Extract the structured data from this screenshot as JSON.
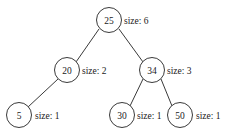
{
  "diagram": {
    "kind": "binary-search-tree-with-subtree-sizes",
    "size_label_prefix": "size:",
    "colors": {
      "background": "#ffffff",
      "stroke": "#3a3a3a",
      "text": "#1a1a1a"
    },
    "nodes": [
      {
        "id": "n25",
        "key": "25",
        "size_text": "size: 6",
        "size_value": 6,
        "cx": 109,
        "cy": 20,
        "r": 12.5,
        "label_x": 124,
        "label_y": 20
      },
      {
        "id": "n20",
        "key": "20",
        "size_text": "size: 2",
        "size_value": 2,
        "cx": 67,
        "cy": 70,
        "r": 12.5,
        "label_x": 82,
        "label_y": 70
      },
      {
        "id": "n34",
        "key": "34",
        "size_text": "size: 3",
        "size_value": 3,
        "cx": 152,
        "cy": 70,
        "r": 12.5,
        "label_x": 167,
        "label_y": 70
      },
      {
        "id": "n5",
        "key": "5",
        "size_text": "size: 1",
        "size_value": 1,
        "cx": 19,
        "cy": 115,
        "r": 12.5,
        "label_x": 35,
        "label_y": 115
      },
      {
        "id": "n30",
        "key": "30",
        "size_text": "size: 1",
        "size_value": 1,
        "cx": 122,
        "cy": 115,
        "r": 12.5,
        "label_x": 137,
        "label_y": 115
      },
      {
        "id": "n50",
        "key": "50",
        "size_text": "size: 1",
        "size_value": 1,
        "cx": 180,
        "cy": 115,
        "r": 12.5,
        "label_x": 196,
        "label_y": 115
      }
    ],
    "edges": [
      {
        "id": "e25-20",
        "from": "n25",
        "to": "n20",
        "x1": 99,
        "y1": 29,
        "x2": 76,
        "y2": 62
      },
      {
        "id": "e25-34",
        "from": "n25",
        "to": "n34",
        "x1": 119,
        "y1": 29,
        "x2": 143,
        "y2": 62
      },
      {
        "id": "e20-5",
        "from": "n20",
        "to": "n5",
        "x1": 58,
        "y1": 79,
        "x2": 28,
        "y2": 107
      },
      {
        "id": "e34-30",
        "from": "n34",
        "to": "n30",
        "x1": 143,
        "y1": 79,
        "x2": 130,
        "y2": 106
      },
      {
        "id": "e34-50",
        "from": "n34",
        "to": "n50",
        "x1": 161,
        "y1": 79,
        "x2": 172,
        "y2": 106
      }
    ]
  }
}
